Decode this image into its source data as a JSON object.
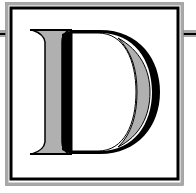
{
  "monogram": {
    "letter": "D",
    "description": "Decorative drop-cap letter D in a double square frame"
  },
  "colors": {
    "background": "#ffffff",
    "frame_outer": "#a8a8a8",
    "frame_inner": "#000000",
    "letter_fill": "#b0b0b0",
    "letter_stroke": "#000000"
  }
}
